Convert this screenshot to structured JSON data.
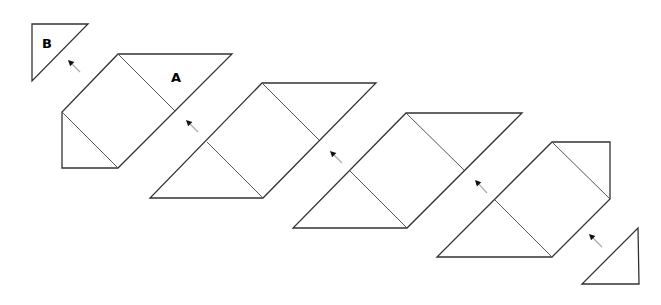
{
  "diagram": {
    "stroke_color": "#333333",
    "labels": [
      {
        "id": "B",
        "text": "B",
        "x": 47,
        "y": 48
      },
      {
        "id": "A",
        "text": "A",
        "x": 176,
        "y": 82
      }
    ],
    "triangle_b": {
      "points": "32,24 88,24 32,81"
    },
    "shapes": [
      {
        "id": "step-1",
        "outline": "118,54 232,54 118,168 62,168 62,112",
        "inner_lines": [
          [
            118,
            54,
            175,
            111
          ],
          [
            62,
            112,
            118,
            168
          ]
        ]
      },
      {
        "id": "step-2",
        "outline": "262,83 376,83 263,198 150,198",
        "inner_lines": [
          [
            262,
            83,
            319,
            140
          ],
          [
            207,
            142,
            263,
            198
          ]
        ]
      },
      {
        "id": "step-3",
        "outline": "406,113 522,113 407,228 293,228",
        "inner_lines": [
          [
            406,
            113,
            464,
            170
          ],
          [
            350,
            171,
            407,
            228
          ]
        ]
      },
      {
        "id": "step-4",
        "outline": "552,142 610,142 610,199 552,257 437,257",
        "inner_lines": [
          [
            552,
            142,
            610,
            199
          ],
          [
            495,
            200,
            552,
            257
          ]
        ]
      }
    ],
    "triangle_end": {
      "points": "638,228 639,284 582,284"
    },
    "arrows": [
      {
        "x1": 80,
        "y1": 72,
        "x2": 68,
        "y2": 60
      },
      {
        "x1": 198,
        "y1": 132,
        "x2": 186,
        "y2": 120
      },
      {
        "x1": 342,
        "y1": 163,
        "x2": 330,
        "y2": 151
      },
      {
        "x1": 487,
        "y1": 193,
        "x2": 475,
        "y2": 180
      },
      {
        "x1": 602,
        "y1": 247,
        "x2": 589,
        "y2": 234
      }
    ]
  }
}
